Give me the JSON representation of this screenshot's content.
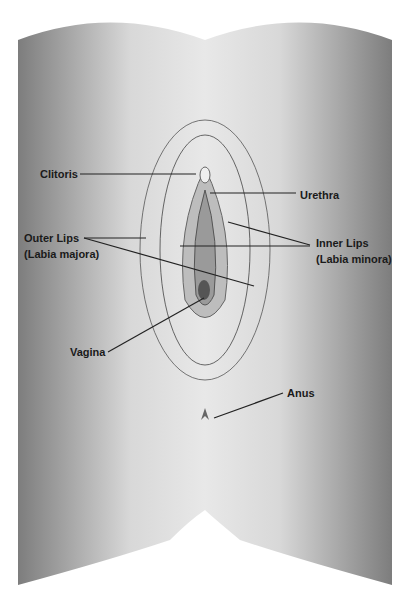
{
  "diagram": {
    "type": "anatomical illustration (schematic)",
    "labels": {
      "clitoris": "Clitoris",
      "urethra": "Urethra",
      "outer_lips_1": "Outer Lips",
      "outer_lips_2": "(Labia majora)",
      "inner_lips_1": "Inner Lips",
      "inner_lips_2": "(Labia minora)",
      "vagina": "Vagina",
      "anus": "Anus"
    }
  }
}
